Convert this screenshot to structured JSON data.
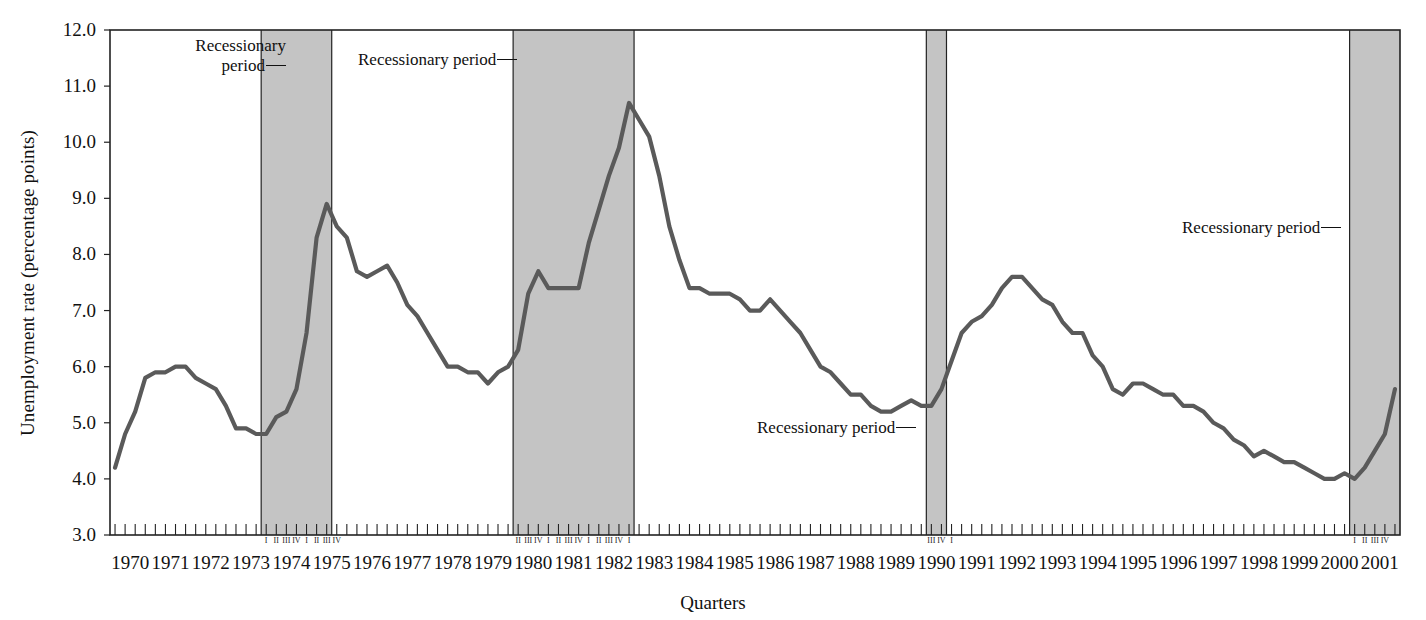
{
  "chart_data": {
    "type": "line",
    "title": "",
    "xlabel": "Quarters",
    "ylabel": "Unemployment rate (percentage points)",
    "ylim": [
      3.0,
      12.0
    ],
    "ytick_labels": [
      "12.0",
      "11.0",
      "10.0",
      "9.0",
      "8.0",
      "7.0",
      "6.0",
      "5.0",
      "4.0",
      "3.0"
    ],
    "ytick_values": [
      12.0,
      11.0,
      10.0,
      9.0,
      8.0,
      7.0,
      6.0,
      5.0,
      4.0,
      3.0
    ],
    "grid": false,
    "legend": "none",
    "series_name": "Unemployment rate",
    "line_color": "#5a5a5a",
    "shade_color": "#c4c4c4",
    "x_start_year": 1970,
    "x_end_year": 2001,
    "year_labels": [
      "1970",
      "1971",
      "1972",
      "1973",
      "1974",
      "1975",
      "1976",
      "1977",
      "1978",
      "1979",
      "1980",
      "1981",
      "1982",
      "1983",
      "1984",
      "1985",
      "1986",
      "1987",
      "1988",
      "1989",
      "1990",
      "1991",
      "1992",
      "1993",
      "1994",
      "1995",
      "1996",
      "1997",
      "1998",
      "1999",
      "2000",
      "2001"
    ],
    "values": [
      4.2,
      4.8,
      5.2,
      5.8,
      5.9,
      5.9,
      6.0,
      6.0,
      5.8,
      5.7,
      5.6,
      5.3,
      4.9,
      4.9,
      4.8,
      4.8,
      5.1,
      5.2,
      5.6,
      6.6,
      8.3,
      8.9,
      8.5,
      8.3,
      7.7,
      7.6,
      7.7,
      7.8,
      7.5,
      7.1,
      6.9,
      6.6,
      6.3,
      6.0,
      6.0,
      5.9,
      5.9,
      5.7,
      5.9,
      6.0,
      6.3,
      7.3,
      7.7,
      7.4,
      7.4,
      7.4,
      7.4,
      8.2,
      8.8,
      9.4,
      9.9,
      10.7,
      10.4,
      10.1,
      9.4,
      8.5,
      7.9,
      7.4,
      7.4,
      7.3,
      7.3,
      7.3,
      7.2,
      7.0,
      7.0,
      7.2,
      7.0,
      6.8,
      6.6,
      6.3,
      6.0,
      5.9,
      5.7,
      5.5,
      5.5,
      5.3,
      5.2,
      5.2,
      5.3,
      5.4,
      5.3,
      5.3,
      5.6,
      6.1,
      6.6,
      6.8,
      6.9,
      7.1,
      7.4,
      7.6,
      7.6,
      7.4,
      7.2,
      7.1,
      6.8,
      6.6,
      6.6,
      6.2,
      6.0,
      5.6,
      5.5,
      5.7,
      5.7,
      5.6,
      5.5,
      5.5,
      5.3,
      5.3,
      5.2,
      5.0,
      4.9,
      4.7,
      4.6,
      4.4,
      4.5,
      4.4,
      4.3,
      4.3,
      4.2,
      4.1,
      4.0,
      4.0,
      4.1,
      4.0,
      4.2,
      4.5,
      4.8,
      5.6
    ],
    "recession_bands": [
      {
        "label": "Recessionary period",
        "start_year": 1973.75,
        "end_year": 1975.5,
        "quarters": [
          "I",
          "II",
          "III",
          "IV",
          "I",
          "II",
          "III",
          "IV"
        ]
      },
      {
        "label": "Recessionary period",
        "start_year": 1980.0,
        "end_year": 1983.0,
        "quarters": [
          "II",
          "III",
          "IV",
          "I",
          "II",
          "III",
          "IV",
          "I",
          "II",
          "III",
          "IV",
          "I"
        ]
      },
      {
        "label": "Recessionary period",
        "start_year": 1990.25,
        "end_year": 1990.75,
        "quarters": [
          "III",
          "IV",
          "I"
        ]
      },
      {
        "label": "Recessionary period",
        "start_year": 2000.75,
        "end_year": 2002.0,
        "quarters": [
          "I",
          "II",
          "III",
          "IV"
        ]
      }
    ],
    "annotations": [
      {
        "id": "ann-1",
        "text_line1": "Recessionary",
        "text_line2": "period"
      },
      {
        "id": "ann-2",
        "text_line1": "Recessionary period",
        "text_line2": ""
      },
      {
        "id": "ann-3",
        "text_line1": "Recessionary period",
        "text_line2": ""
      },
      {
        "id": "ann-4",
        "text_line1": "Recessionary period",
        "text_line2": ""
      }
    ]
  }
}
